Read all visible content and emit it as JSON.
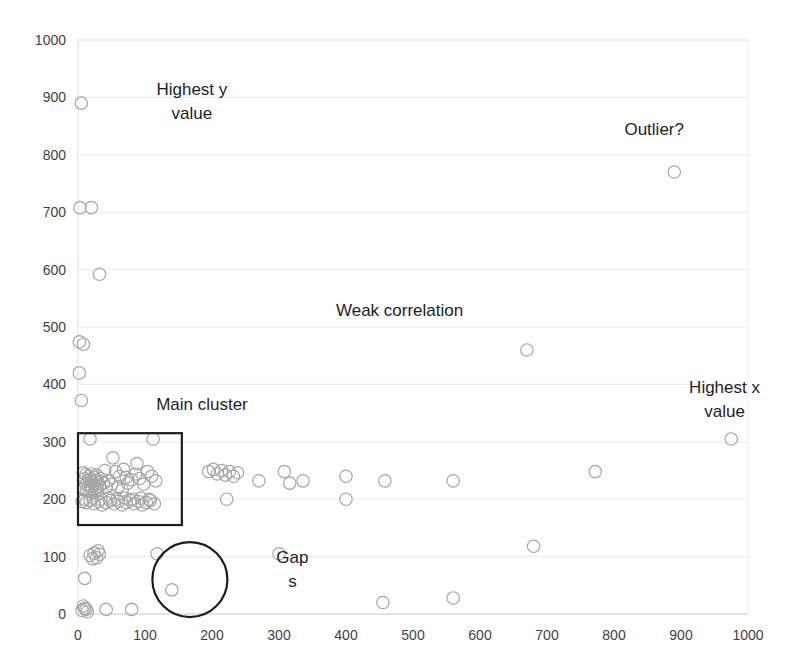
{
  "chart_data": {
    "type": "scatter",
    "title": "",
    "xlabel": "",
    "ylabel": "",
    "xlim": [
      0,
      1000
    ],
    "ylim": [
      0,
      1000
    ],
    "grid": true,
    "legend": "none",
    "xticks": [
      "0",
      "100",
      "200",
      "300",
      "400",
      "500",
      "600",
      "700",
      "800",
      "900",
      "1000"
    ],
    "yticks": [
      "0",
      "100",
      "200",
      "300",
      "400",
      "500",
      "600",
      "700",
      "800",
      "900",
      "1000"
    ],
    "marker_color": "#a6a6a6",
    "annotation_color": "#1d1d1d",
    "series": [
      {
        "name": "data",
        "points": [
          [
            5,
            890
          ],
          [
            3,
            708
          ],
          [
            20,
            708
          ],
          [
            32,
            592
          ],
          [
            2,
            474
          ],
          [
            8,
            470
          ],
          [
            2,
            420
          ],
          [
            5,
            372
          ],
          [
            18,
            305
          ],
          [
            112,
            305
          ],
          [
            52,
            272
          ],
          [
            88,
            262
          ],
          [
            8,
            246
          ],
          [
            12,
            243
          ],
          [
            16,
            240
          ],
          [
            20,
            244
          ],
          [
            24,
            238
          ],
          [
            28,
            242
          ],
          [
            10,
            236
          ],
          [
            14,
            232
          ],
          [
            18,
            234
          ],
          [
            22,
            230
          ],
          [
            26,
            233
          ],
          [
            30,
            229
          ],
          [
            12,
            226
          ],
          [
            16,
            224
          ],
          [
            20,
            222
          ],
          [
            24,
            225
          ],
          [
            28,
            220
          ],
          [
            32,
            223
          ],
          [
            9,
            218
          ],
          [
            13,
            216
          ],
          [
            17,
            214
          ],
          [
            21,
            217
          ],
          [
            25,
            212
          ],
          [
            29,
            215
          ],
          [
            34,
            236
          ],
          [
            38,
            228
          ],
          [
            42,
            221
          ],
          [
            46,
            233
          ],
          [
            50,
            226
          ],
          [
            40,
            250
          ],
          [
            56,
            248
          ],
          [
            62,
            240
          ],
          [
            68,
            252
          ],
          [
            72,
            238
          ],
          [
            60,
            222
          ],
          [
            66,
            216
          ],
          [
            74,
            228
          ],
          [
            80,
            234
          ],
          [
            86,
            244
          ],
          [
            92,
            236
          ],
          [
            98,
            226
          ],
          [
            104,
            248
          ],
          [
            110,
            240
          ],
          [
            116,
            232
          ],
          [
            6,
            196
          ],
          [
            12,
            194
          ],
          [
            18,
            198
          ],
          [
            24,
            192
          ],
          [
            30,
            196
          ],
          [
            36,
            190
          ],
          [
            42,
            194
          ],
          [
            48,
            198
          ],
          [
            54,
            192
          ],
          [
            60,
            196
          ],
          [
            66,
            190
          ],
          [
            72,
            194
          ],
          [
            78,
            198
          ],
          [
            84,
            192
          ],
          [
            90,
            196
          ],
          [
            96,
            190
          ],
          [
            102,
            194
          ],
          [
            108,
            198
          ],
          [
            114,
            192
          ],
          [
            10,
            200
          ],
          [
            22,
            202
          ],
          [
            34,
            200
          ],
          [
            46,
            202
          ],
          [
            58,
            200
          ],
          [
            70,
            202
          ],
          [
            82,
            200
          ],
          [
            94,
            202
          ],
          [
            106,
            200
          ],
          [
            195,
            248
          ],
          [
            202,
            252
          ],
          [
            208,
            244
          ],
          [
            214,
            250
          ],
          [
            220,
            242
          ],
          [
            226,
            248
          ],
          [
            232,
            240
          ],
          [
            238,
            246
          ],
          [
            222,
            200
          ],
          [
            270,
            232
          ],
          [
            308,
            248
          ],
          [
            316,
            228
          ],
          [
            336,
            232
          ],
          [
            400,
            240
          ],
          [
            400,
            200
          ],
          [
            458,
            232
          ],
          [
            560,
            232
          ],
          [
            670,
            460
          ],
          [
            772,
            248
          ],
          [
            890,
            770
          ],
          [
            975,
            305
          ],
          [
            680,
            118
          ],
          [
            300,
            105
          ],
          [
            118,
            105
          ],
          [
            18,
            102
          ],
          [
            24,
            106
          ],
          [
            28,
            98
          ],
          [
            32,
            104
          ],
          [
            22,
            96
          ],
          [
            30,
            110
          ],
          [
            10,
            62
          ],
          [
            140,
            42
          ],
          [
            6,
            6
          ],
          [
            10,
            10
          ],
          [
            14,
            4
          ],
          [
            8,
            14
          ],
          [
            12,
            8
          ],
          [
            42,
            8
          ],
          [
            80,
            8
          ],
          [
            455,
            20
          ],
          [
            560,
            28
          ]
        ]
      }
    ],
    "annotations": [
      {
        "id": "highest-y",
        "text_line1": "Highest y",
        "text_line2": "value",
        "x": 170,
        "y": 905
      },
      {
        "id": "outlier",
        "text_line1": "Outlier?",
        "text_line2": "",
        "x": 860,
        "y": 835
      },
      {
        "id": "weak-correlation",
        "text_line1": "Weak correlation",
        "text_line2": "",
        "x": 480,
        "y": 520
      },
      {
        "id": "highest-x",
        "text_line1": "Highest x",
        "text_line2": "value",
        "x": 965,
        "y": 385
      },
      {
        "id": "main-cluster",
        "text_line1": "Main cluster",
        "text_line2": "",
        "x": 185,
        "y": 355
      },
      {
        "id": "gaps",
        "text_line1": "Gap",
        "text_line2": "s",
        "x": 320,
        "y": 88
      }
    ],
    "shapes": [
      {
        "id": "main-cluster-box",
        "type": "rect",
        "x0": 0,
        "y0": 155,
        "x1": 155,
        "y1": 315
      },
      {
        "id": "gap-circle",
        "type": "circle",
        "cx": 167,
        "cy": 60,
        "r": 56
      }
    ]
  }
}
